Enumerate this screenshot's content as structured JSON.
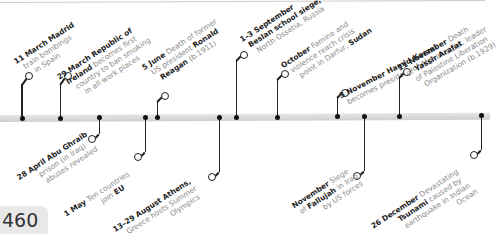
{
  "page": {
    "number": "460"
  },
  "colors": {
    "bar": "#d9d9d9",
    "marker": "#222222",
    "date_text": "#222222",
    "body_text": "#8a8a8a"
  },
  "events_above": [
    {
      "date": "11 March",
      "bold": "Madrid",
      "lines": [
        "train bombings",
        "in Spain"
      ]
    },
    {
      "date": "29 March",
      "bold": "Republic of",
      "lines": [
        "Ireland becomes first",
        "country to ban smoking",
        "in all work places"
      ],
      "bold_second": "Ireland"
    },
    {
      "date": "5 June",
      "text": "Death of former",
      "lines": [
        "US president Ronald",
        "Reagan (b.1911)"
      ]
    },
    {
      "date": "1–3 September",
      "lines": [
        "Beslan school siege,",
        "North Ossetia, Russia"
      ]
    },
    {
      "date": "October",
      "text": "Famine and",
      "lines": [
        "violence reach crisis",
        "point in Darfur, Sudan"
      ]
    },
    {
      "date": "3 November",
      "bold": "Hamid Karzai",
      "lines": [
        "becomes president of Afghanistan"
      ]
    },
    {
      "date": "11 November",
      "text": "Death",
      "lines": [
        "of Yassir Arafat, leader",
        "of Palestine Liberation",
        "Organization (b.1929)"
      ]
    }
  ],
  "events_below": [
    {
      "date": "28 April",
      "bold": "Abu Ghraib",
      "lines": [
        "prison (in Iraq)",
        "abuses revealed"
      ]
    },
    {
      "date": "1 May",
      "text": "Ten countries",
      "lines": [
        "join EU"
      ]
    },
    {
      "date": "13–29 August",
      "bold": "Athens,",
      "lines": [
        "Greece hosts Summer",
        "Olympics"
      ]
    },
    {
      "date": "November",
      "text": "Siege",
      "lines": [
        "of Fallujah in Iraq",
        "by US forces"
      ]
    },
    {
      "date": "26 December",
      "text": "Devastating",
      "lines": [
        "Tsunami caused by",
        "earthquake in Indian",
        "Ocean"
      ]
    }
  ],
  "labels": {
    "e1": {
      "d": "11 March",
      "b": "Madrid",
      "l1": "train bombings",
      "l2": "in Spain"
    },
    "e2": {
      "d": "29 March",
      "b": "Republic of",
      "b2": "Ireland",
      "t2": " becomes first",
      "l3": "country to ban smoking",
      "l4": "in all work places"
    },
    "e3": {
      "d": "5 June",
      "t": " Death of former",
      "t2": "US president ",
      "b2": "Ronald",
      "b3": "Reagan",
      "t3": " (b.1911)"
    },
    "e4": {
      "d": "1–3 September",
      "b2": "Beslan school siege,",
      "l3": "North Ossetia, Russia"
    },
    "e5": {
      "d": "October",
      "t": " Famine and",
      "l2": "violence reach crisis",
      "t3": "point in Darfur, ",
      "b3": "Sudan"
    },
    "e6": {
      "d": "3 November",
      "b": " Hamid Karzai",
      "l2": "becomes president of Afghanistan"
    },
    "e7": {
      "d": "11 November",
      "t": " Death",
      "t2": "of ",
      "b2": "Yassir Arafat",
      "t2b": ", leader",
      "l3": "of Palestine Liberation",
      "l4": "Organization (b.1929)"
    },
    "e8": {
      "d": "28 April",
      "b": " Abu Ghraib",
      "l2": "prison (in Iraq)",
      "l3": "abuses revealed"
    },
    "e9": {
      "d": "1 May",
      "t": " Ten countries",
      "t2": "join ",
      "b2": "EU"
    },
    "e10": {
      "d": "13–29 August",
      "b": " Athens,",
      "l2": "Greece hosts Summer",
      "l3": "Olympics"
    },
    "e11": {
      "d": "November",
      "t": " Siege",
      "t2": "of ",
      "b2": "Fallujah",
      "t2b": " in Iraq",
      "l3": "by US forces"
    },
    "e12": {
      "d": "26 December",
      "t": " Devastating",
      "b2": "Tsunami",
      "t2": " caused by",
      "l3": "earthquake in Indian",
      "l4": "Ocean"
    }
  }
}
